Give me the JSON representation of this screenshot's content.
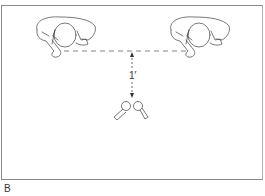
{
  "figure": {
    "panel_label": "B",
    "distance_label": "1′",
    "elements": [
      {
        "type": "person-top-view",
        "position": "left"
      },
      {
        "type": "person-top-view",
        "position": "right"
      },
      {
        "type": "dashed-line",
        "connects": [
          "left-person",
          "right-person"
        ]
      },
      {
        "type": "dimension-arrow",
        "label": "1′"
      },
      {
        "type": "microphone-pair",
        "count": 2
      }
    ],
    "colors": {
      "line": "#555555",
      "frame": "#8a8a8a"
    }
  }
}
